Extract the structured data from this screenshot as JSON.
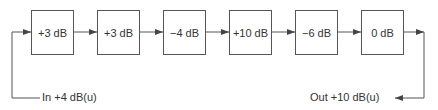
{
  "diagram": {
    "stages": [
      {
        "gain": "+3 dB"
      },
      {
        "gain": "+3 dB"
      },
      {
        "gain": "−4 dB"
      },
      {
        "gain": "+10 dB"
      },
      {
        "gain": "−6 dB"
      },
      {
        "gain": "0 dB"
      }
    ],
    "input_label": "In +4 dB(u)",
    "output_label": "Out +10 dB(u)",
    "line_color": "#555555"
  }
}
